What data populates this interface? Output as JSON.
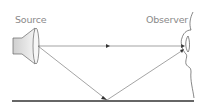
{
  "diagram": {
    "labels": {
      "source": "Source",
      "observer": "Observer"
    },
    "elements": {
      "source_icon": "speaker-icon",
      "observer_icon": "ear-face-profile-icon",
      "ground": "reflecting-surface"
    },
    "paths": [
      {
        "name": "direct-path",
        "from": "Source",
        "to": "Observer"
      },
      {
        "name": "reflected-path",
        "from": "Source",
        "via": "ground",
        "to": "Observer"
      }
    ],
    "colors": {
      "line": "#555555",
      "ground": "#333333",
      "label": "#8a8a8a",
      "speaker_fill": "#e6e6e6"
    }
  }
}
